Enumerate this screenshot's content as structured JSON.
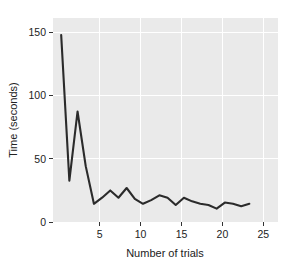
{
  "chart_data": {
    "type": "line",
    "title": "",
    "xlabel": "Number of trials",
    "ylabel": "Time (seconds)",
    "xlim": [
      0,
      27.5
    ],
    "ylim": [
      -6,
      162
    ],
    "xticks": [
      5,
      10,
      15,
      20,
      25
    ],
    "xtick_labels": [
      "5",
      "10",
      "15",
      "20",
      "25"
    ],
    "yticks": [
      0,
      50,
      100,
      150
    ],
    "ytick_labels": [
      "0",
      "50",
      "100",
      "150"
    ],
    "grid": true,
    "legend": null,
    "series": [
      {
        "name": "Time per trial",
        "x": [
          1,
          2,
          3,
          4,
          5,
          6,
          7,
          8,
          9,
          10,
          11,
          12,
          13,
          14,
          15,
          16,
          17,
          18,
          19,
          20,
          21,
          22,
          23,
          24
        ],
        "values": [
          148,
          28,
          85,
          40,
          9,
          14,
          20,
          14,
          22,
          13,
          9,
          12,
          16,
          14,
          8,
          14,
          11,
          9,
          8,
          5,
          10,
          9,
          7,
          9
        ]
      }
    ],
    "style": {
      "plot_background": "#eaeaea",
      "grid_color": "#ffffff",
      "line_color": "#2b2b2b",
      "text_color": "#222222",
      "figure_background": "#ffffff"
    }
  },
  "axes": {
    "y_axis_title": "Time (seconds)",
    "x_axis_title": "Number of trials"
  }
}
